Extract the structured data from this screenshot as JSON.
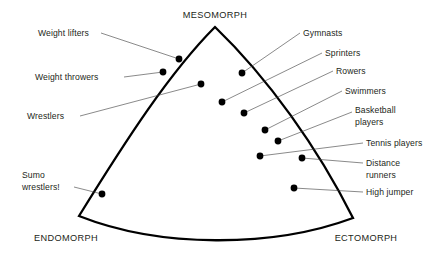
{
  "diagram": {
    "outline_color": "#000000",
    "dot_color": "#000000",
    "leader_color": "#3a3a3a",
    "text_color": "#231f20",
    "background": "#ffffff"
  },
  "corners": [
    {
      "id": "mesomorph",
      "label": "MESOMORPH",
      "x": 215,
      "y": 18,
      "anchor": "middle"
    },
    {
      "id": "endomorph",
      "label": "ENDOMORPH",
      "x": 66,
      "y": 241,
      "anchor": "middle"
    },
    {
      "id": "ectomorph",
      "label": "ECTOMORPH",
      "x": 366,
      "y": 241,
      "anchor": "middle"
    }
  ],
  "shape": {
    "vertices": [
      {
        "name": "mesomorph-apex",
        "x": 215,
        "y": 27
      },
      {
        "name": "endomorph-corner",
        "x": 79,
        "y": 216
      },
      {
        "name": "ectomorph-corner",
        "x": 353,
        "y": 218
      }
    ],
    "edges": [
      {
        "name": "left-edge",
        "from": "mesomorph-apex",
        "to": "endomorph-corner",
        "bulge": "outward-left"
      },
      {
        "name": "bottom-edge",
        "from": "endomorph-corner",
        "to": "ectomorph-corner",
        "bulge": "outward-down"
      },
      {
        "name": "right-edge",
        "from": "ectomorph-corner",
        "to": "mesomorph-apex",
        "bulge": "outward-right"
      }
    ]
  },
  "athletes": [
    {
      "id": "weight-lifters",
      "label": "Weight lifters",
      "label_x": 38,
      "label_y": 36,
      "label_anchor": "start",
      "leader": [
        [
          101,
          33
        ],
        [
          179,
          59
        ]
      ],
      "dot": {
        "x": 179,
        "y": 59
      }
    },
    {
      "id": "weight-throwers",
      "label": "Weight throwers",
      "label_x": 35,
      "label_y": 80,
      "label_anchor": "start",
      "leader": [
        [
          124,
          77
        ],
        [
          163,
          72
        ]
      ],
      "dot": {
        "x": 163,
        "y": 72
      }
    },
    {
      "id": "wrestlers",
      "label": "Wrestlers",
      "label_x": 27,
      "label_y": 119,
      "label_anchor": "start",
      "leader": [
        [
          80,
          116
        ],
        [
          201,
          84
        ]
      ],
      "dot": {
        "x": 201,
        "y": 84
      }
    },
    {
      "id": "sumo-wrestlers",
      "label": "Sumo",
      "label2": "wrestlers!",
      "label_x": 22,
      "label_y": 178,
      "label_anchor": "start",
      "label2_x": 22,
      "label2_y": 190,
      "leader": [
        [
          74,
          187
        ],
        [
          102,
          194
        ]
      ],
      "dot": {
        "x": 102,
        "y": 194
      }
    },
    {
      "id": "gymnasts",
      "label": "Gymnasts",
      "label_x": 303,
      "label_y": 36,
      "label_anchor": "start",
      "leader": [
        [
          300,
          33
        ],
        [
          242,
          73
        ]
      ],
      "dot": {
        "x": 242,
        "y": 73
      }
    },
    {
      "id": "sprinters",
      "label": "Sprinters",
      "label_x": 325,
      "label_y": 56,
      "label_anchor": "start",
      "leader": [
        [
          322,
          53
        ],
        [
          222,
          102
        ]
      ],
      "dot": {
        "x": 222,
        "y": 102
      }
    },
    {
      "id": "rowers",
      "label": "Rowers",
      "label_x": 336,
      "label_y": 74,
      "label_anchor": "start",
      "leader": [
        [
          333,
          71
        ],
        [
          244,
          113
        ]
      ],
      "dot": {
        "x": 244,
        "y": 113
      }
    },
    {
      "id": "swimmers",
      "label": "Swimmers",
      "label_x": 345,
      "label_y": 94,
      "label_anchor": "start",
      "leader": [
        [
          342,
          91
        ],
        [
          265,
          130
        ]
      ],
      "dot": {
        "x": 265,
        "y": 130
      }
    },
    {
      "id": "basketball-players",
      "label": "Basketball",
      "label2": "players",
      "label_x": 355,
      "label_y": 113,
      "label_anchor": "start",
      "label2_x": 355,
      "label2_y": 125,
      "leader": [
        [
          352,
          112
        ],
        [
          278,
          141
        ]
      ],
      "dot": {
        "x": 278,
        "y": 141
      }
    },
    {
      "id": "tennis-players",
      "label": "Tennis players",
      "label_x": 366,
      "label_y": 146,
      "label_anchor": "start",
      "leader": [
        [
          363,
          143
        ],
        [
          260,
          156
        ]
      ],
      "dot": {
        "x": 260,
        "y": 156
      }
    },
    {
      "id": "distance-runners",
      "label": "Distance",
      "label2": "runners",
      "label_x": 366,
      "label_y": 166,
      "label_anchor": "start",
      "label2_x": 366,
      "label2_y": 178,
      "leader": [
        [
          363,
          163
        ],
        [
          302,
          158
        ]
      ],
      "dot": {
        "x": 302,
        "y": 158
      }
    },
    {
      "id": "high-jumper",
      "label": "High jumper",
      "label_x": 366,
      "label_y": 195,
      "label_anchor": "start",
      "leader": [
        [
          363,
          192
        ],
        [
          294,
          188
        ]
      ],
      "dot": {
        "x": 294,
        "y": 188
      }
    }
  ]
}
